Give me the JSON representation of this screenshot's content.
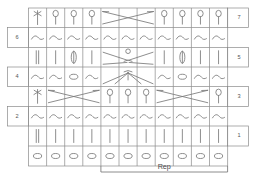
{
  "chart": {
    "type": "knitting-chart",
    "columns": 11,
    "rows": 8,
    "repeat_label": "Rep",
    "repeat_start_column": 5,
    "repeat_end_column": 11,
    "grid_color": "#8a8a8a",
    "symbol_color": "#7a7a7a",
    "background_color": "#ffffff",
    "row_numbers_right": [
      "7",
      "5",
      "3",
      "1"
    ],
    "row_numbers_left": [
      "6",
      "4",
      "2"
    ],
    "legend_symbols": [
      {
        "name": "oval",
        "meaning": "chain / foundation stitch"
      },
      {
        "name": "vertical-bar",
        "meaning": "single crochet"
      },
      {
        "name": "wave",
        "meaning": "slip stitch / turning"
      },
      {
        "name": "lollipop",
        "meaning": "double crochet"
      },
      {
        "name": "cross-stitch",
        "meaning": "crossed stitch"
      },
      {
        "name": "x-cable",
        "meaning": "cable cross over 3 stitches"
      },
      {
        "name": "fan-increase",
        "meaning": "shell / increase"
      },
      {
        "name": "v-decrease",
        "meaning": "cluster decrease"
      }
    ],
    "rows_data": [
      {
        "index": 7,
        "label_side": "right",
        "label": "7",
        "cells": [
          {
            "col": 1,
            "symbol": "cross-stitch"
          },
          {
            "col": 2,
            "symbol": "lollipop"
          },
          {
            "col": 3,
            "symbol": "lollipop"
          },
          {
            "col": 4,
            "symbol": "lollipop"
          },
          {
            "col": 5,
            "symbol": "x-cable-span3",
            "span": 3
          },
          {
            "col": 8,
            "symbol": "lollipop"
          },
          {
            "col": 9,
            "symbol": "lollipop"
          },
          {
            "col": 10,
            "symbol": "lollipop"
          },
          {
            "col": 11,
            "symbol": "lollipop"
          }
        ]
      },
      {
        "index": 6,
        "label_side": "left",
        "label": "6",
        "cells": [
          {
            "col": 1,
            "symbol": "wave"
          },
          {
            "col": 2,
            "symbol": "wave"
          },
          {
            "col": 3,
            "symbol": "wave"
          },
          {
            "col": 4,
            "symbol": "wave"
          },
          {
            "col": 5,
            "symbol": "wave"
          },
          {
            "col": 6,
            "symbol": "wave"
          },
          {
            "col": 7,
            "symbol": "wave"
          },
          {
            "col": 8,
            "symbol": "wave"
          },
          {
            "col": 9,
            "symbol": "wave"
          },
          {
            "col": 10,
            "symbol": "wave"
          },
          {
            "col": 11,
            "symbol": "wave"
          }
        ]
      },
      {
        "index": 5,
        "label_side": "right",
        "label": "5",
        "cells": [
          {
            "col": 1,
            "symbol": "vertical-bar-double"
          },
          {
            "col": 2,
            "symbol": "vertical-bar"
          },
          {
            "col": 3,
            "symbol": "oval-upright"
          },
          {
            "col": 4,
            "symbol": "vertical-bar"
          },
          {
            "col": 5,
            "symbol": "v-decrease-span3",
            "span": 3
          },
          {
            "col": 8,
            "symbol": "vertical-bar"
          },
          {
            "col": 9,
            "symbol": "oval-upright"
          },
          {
            "col": 10,
            "symbol": "vertical-bar"
          },
          {
            "col": 11,
            "symbol": "vertical-bar"
          }
        ]
      },
      {
        "index": 4,
        "label_side": "left",
        "label": "4",
        "cells": [
          {
            "col": 1,
            "symbol": "wave"
          },
          {
            "col": 2,
            "symbol": "wave"
          },
          {
            "col": 3,
            "symbol": "oval-flat"
          },
          {
            "col": 4,
            "symbol": "wave"
          },
          {
            "col": 5,
            "symbol": "fan-increase-span3",
            "span": 3
          },
          {
            "col": 8,
            "symbol": "wave"
          },
          {
            "col": 9,
            "symbol": "oval-flat"
          },
          {
            "col": 10,
            "symbol": "wave"
          },
          {
            "col": 11,
            "symbol": "wave"
          }
        ]
      },
      {
        "index": 3,
        "label_side": "right",
        "label": "3",
        "cells": [
          {
            "col": 1,
            "symbol": "cross-stitch"
          },
          {
            "col": 2,
            "symbol": "x-cable-span3",
            "span": 3
          },
          {
            "col": 5,
            "symbol": "lollipop"
          },
          {
            "col": 6,
            "symbol": "lollipop"
          },
          {
            "col": 7,
            "symbol": "lollipop"
          },
          {
            "col": 8,
            "symbol": "x-cable-span3",
            "span": 3
          },
          {
            "col": 11,
            "symbol": "lollipop"
          }
        ]
      },
      {
        "index": 2,
        "label_side": "left",
        "label": "2",
        "cells": [
          {
            "col": 1,
            "symbol": "wave"
          },
          {
            "col": 2,
            "symbol": "wave"
          },
          {
            "col": 3,
            "symbol": "wave"
          },
          {
            "col": 4,
            "symbol": "wave"
          },
          {
            "col": 5,
            "symbol": "wave"
          },
          {
            "col": 6,
            "symbol": "wave"
          },
          {
            "col": 7,
            "symbol": "wave"
          },
          {
            "col": 8,
            "symbol": "wave"
          },
          {
            "col": 9,
            "symbol": "wave"
          },
          {
            "col": 10,
            "symbol": "wave"
          },
          {
            "col": 11,
            "symbol": "wave"
          }
        ]
      },
      {
        "index": 1,
        "label_side": "right",
        "label": "1",
        "cells": [
          {
            "col": 1,
            "symbol": "vertical-bar-double"
          },
          {
            "col": 2,
            "symbol": "vertical-bar"
          },
          {
            "col": 3,
            "symbol": "vertical-bar"
          },
          {
            "col": 4,
            "symbol": "vertical-bar"
          },
          {
            "col": 5,
            "symbol": "vertical-bar"
          },
          {
            "col": 6,
            "symbol": "vertical-bar"
          },
          {
            "col": 7,
            "symbol": "vertical-bar"
          },
          {
            "col": 8,
            "symbol": "vertical-bar"
          },
          {
            "col": 9,
            "symbol": "vertical-bar"
          },
          {
            "col": 10,
            "symbol": "vertical-bar"
          },
          {
            "col": 11,
            "symbol": "vertical-bar"
          }
        ]
      },
      {
        "index": 0,
        "label_side": "none",
        "label": "",
        "cells": [
          {
            "col": 1,
            "symbol": "oval-flat"
          },
          {
            "col": 2,
            "symbol": "oval-flat"
          },
          {
            "col": 3,
            "symbol": "oval-flat"
          },
          {
            "col": 4,
            "symbol": "oval-flat"
          },
          {
            "col": 5,
            "symbol": "oval-flat"
          },
          {
            "col": 6,
            "symbol": "oval-flat"
          },
          {
            "col": 7,
            "symbol": "oval-flat"
          },
          {
            "col": 8,
            "symbol": "oval-flat"
          },
          {
            "col": 9,
            "symbol": "oval-flat"
          },
          {
            "col": 10,
            "symbol": "oval-flat"
          },
          {
            "col": 11,
            "symbol": "oval-flat"
          }
        ]
      }
    ]
  }
}
